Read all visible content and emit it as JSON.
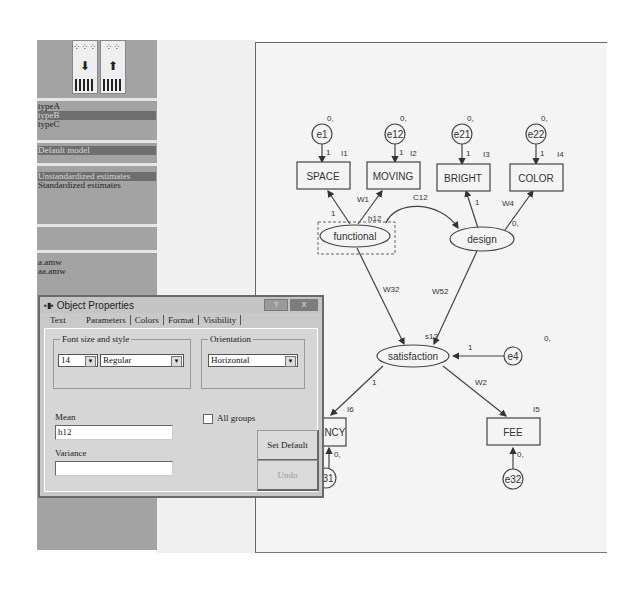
{
  "toolbar": {
    "buttons": [
      {
        "name": "move-down-button",
        "icon": "arrow-down",
        "glyph": "⬇",
        "dots": "⁘⁘⁘"
      },
      {
        "name": "move-up-button",
        "icon": "arrow-up",
        "glyph": "⬆",
        "dots": "⁘⁘"
      }
    ]
  },
  "groups_list": [
    "typeA",
    "typeB",
    "typeC"
  ],
  "groups_selected": 1,
  "models_list": [
    "Default model"
  ],
  "estimates_list": [
    "Unstandardized estimates",
    "Standardized estimates"
  ],
  "files_list": [
    "a.amw",
    "aa.amw"
  ],
  "diagram": {
    "observed": [
      {
        "id": "SPACE",
        "label": "SPACE",
        "intercept": "I1"
      },
      {
        "id": "MOVING",
        "label": "MOVING",
        "intercept": "I2"
      },
      {
        "id": "BRIGHT",
        "label": "BRIGHT",
        "intercept": "I3"
      },
      {
        "id": "COLOR",
        "label": "COLOR",
        "intercept": "I4"
      },
      {
        "id": "FREQUENCY",
        "label": "UENCY",
        "intercept": "I6"
      },
      {
        "id": "FEE",
        "label": "FEE",
        "intercept": "I5"
      }
    ],
    "errors": [
      {
        "label": "e1",
        "mean": "0,",
        "weight": "1"
      },
      {
        "label": "e12",
        "mean": "0,",
        "weight": "1"
      },
      {
        "label": "e21",
        "mean": "0,",
        "weight": "1"
      },
      {
        "label": "e22",
        "mean": "0,",
        "weight": "1"
      },
      {
        "label": "e4",
        "mean": "0,",
        "weight": "1"
      },
      {
        "label": "31",
        "mean": "0,",
        "weight": "1"
      },
      {
        "label": "e32",
        "mean": "0,",
        "weight": "1"
      }
    ],
    "latent": [
      {
        "label": "functional",
        "mean": "h12"
      },
      {
        "label": "design",
        "mean": "0,"
      },
      {
        "label": "satisfaction",
        "mean": "s12"
      }
    ],
    "paths": {
      "functional_space": "1",
      "functional_moving": "W1",
      "covariance": "C12",
      "design_bright": "1",
      "design_color": "W4",
      "functional_satisfaction": "W32",
      "design_satisfaction": "W52",
      "satisfaction_frequency": "1",
      "satisfaction_fee": "W2",
      "e4_satisfaction": "1"
    }
  },
  "dialog": {
    "title": "Object Properties",
    "help_btn": "?",
    "close_btn": "X",
    "tabs": [
      "Text",
      "Parameters",
      "Colors",
      "Format",
      "Visibility"
    ],
    "active_tab": "Parameters",
    "font_group": "Font size and style",
    "font_size": "14",
    "font_style": "Regular",
    "orientation_group": "Orientation",
    "orientation": "Horizontal",
    "mean_label": "Mean",
    "mean_value": "h12",
    "variance_label": "Variance",
    "variance_value": "",
    "all_groups_label": "All groups",
    "set_default": "Set Default",
    "undo": "Undo"
  }
}
